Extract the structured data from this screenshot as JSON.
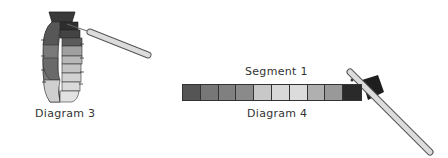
{
  "diagram3": {
    "label": "Diagram 3",
    "ring_band_colors": [
      "#2e2e2e",
      "#444444",
      "#5c5c5c",
      "#707070",
      "#868686",
      "#a0a0a0",
      "#c4c4c4",
      "#dadada"
    ]
  },
  "diagram4": {
    "label": "Diagram 4",
    "segment_label": "Segment 1",
    "cells": [
      {
        "color": "#555555"
      },
      {
        "color": "#777777"
      },
      {
        "color": "#808080"
      },
      {
        "color": "#8a8a8a"
      },
      {
        "color": "#c8c8c8"
      },
      {
        "color": "#d8d8d8"
      },
      {
        "color": "#dcdcdc"
      },
      {
        "color": "#b0b0b0"
      },
      {
        "color": "#999999"
      },
      {
        "color": "#2a2a2a"
      }
    ]
  }
}
